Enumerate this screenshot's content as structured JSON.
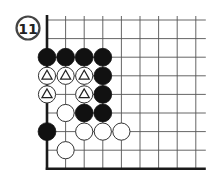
{
  "diagram": {
    "number": "11",
    "colors": {
      "line": "#555555",
      "edge": "#1a1a1a",
      "black": "#111111",
      "white": "#ffffff",
      "stone_outline": "#333333"
    },
    "grid": {
      "origin_x": 47,
      "origin_y": 20,
      "spacing": 18.6,
      "cols": 9,
      "rows": 9,
      "left_edge": true,
      "bottom_edge": true,
      "top_open": true,
      "right_open": true
    },
    "stones": [
      {
        "col": 0,
        "row": 2,
        "color": "black"
      },
      {
        "col": 1,
        "row": 2,
        "color": "black"
      },
      {
        "col": 2,
        "row": 2,
        "color": "black"
      },
      {
        "col": 3,
        "row": 2,
        "color": "black"
      },
      {
        "col": 0,
        "row": 3,
        "color": "white",
        "mark": "triangle"
      },
      {
        "col": 1,
        "row": 3,
        "color": "white",
        "mark": "triangle"
      },
      {
        "col": 2,
        "row": 3,
        "color": "white",
        "mark": "triangle"
      },
      {
        "col": 3,
        "row": 3,
        "color": "black"
      },
      {
        "col": 0,
        "row": 4,
        "color": "white",
        "mark": "triangle"
      },
      {
        "col": 2,
        "row": 4,
        "color": "white",
        "mark": "triangle"
      },
      {
        "col": 3,
        "row": 4,
        "color": "black"
      },
      {
        "col": 1,
        "row": 5,
        "color": "white"
      },
      {
        "col": 2,
        "row": 5,
        "color": "black"
      },
      {
        "col": 3,
        "row": 5,
        "color": "black"
      },
      {
        "col": 0,
        "row": 6,
        "color": "black"
      },
      {
        "col": 2,
        "row": 6,
        "color": "white"
      },
      {
        "col": 3,
        "row": 6,
        "color": "white"
      },
      {
        "col": 4,
        "row": 6,
        "color": "white"
      },
      {
        "col": 1,
        "row": 7,
        "color": "white"
      }
    ]
  }
}
